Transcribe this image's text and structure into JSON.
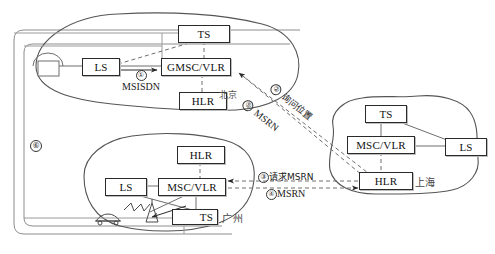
{
  "diagram": {
    "regions": [
      {
        "id": "beijing",
        "name": "北京",
        "label_x": 219,
        "label_y": 88
      },
      {
        "id": "shanghai",
        "name": "上海",
        "label_x": 415,
        "label_y": 176
      },
      {
        "id": "guangzhou",
        "name": "广州",
        "label_x": 212,
        "label_y": 212
      }
    ],
    "nodes": [
      {
        "id": "bj-ts",
        "label": "TS",
        "x": 178,
        "y": 25,
        "w": 50,
        "h": 16,
        "region": "beijing"
      },
      {
        "id": "bj-ls",
        "label": "LS",
        "x": 82,
        "y": 58,
        "w": 36,
        "h": 16,
        "region": "beijing"
      },
      {
        "id": "bj-gmsc",
        "label": "GMSC/VLR",
        "x": 161,
        "y": 58,
        "w": 68,
        "h": 16,
        "region": "beijing"
      },
      {
        "id": "bj-hlr",
        "label": "HLR",
        "x": 179,
        "y": 92,
        "w": 46,
        "h": 16,
        "region": "beijing"
      },
      {
        "id": "sh-ts",
        "label": "TS",
        "x": 365,
        "y": 105,
        "w": 40,
        "h": 16,
        "region": "shanghai"
      },
      {
        "id": "sh-mscvlr",
        "label": "MSC/VLR",
        "x": 347,
        "y": 136,
        "w": 66,
        "h": 16,
        "region": "shanghai"
      },
      {
        "id": "sh-ls",
        "label": "LS",
        "x": 445,
        "y": 138,
        "w": 40,
        "h": 16,
        "region": "shanghai"
      },
      {
        "id": "sh-hlr",
        "label": "HLR",
        "x": 359,
        "y": 172,
        "w": 52,
        "h": 16,
        "region": "shanghai"
      },
      {
        "id": "gz-hlr",
        "label": "HLR",
        "x": 177,
        "y": 146,
        "w": 46,
        "h": 16,
        "region": "guangzhou"
      },
      {
        "id": "gz-ls",
        "label": "LS",
        "x": 105,
        "y": 178,
        "w": 40,
        "h": 16,
        "region": "guangzhou"
      },
      {
        "id": "gz-mscvlr",
        "label": "MSC/VLR",
        "x": 158,
        "y": 178,
        "w": 66,
        "h": 16,
        "region": "guangzhou"
      },
      {
        "id": "gz-ts",
        "label": "TS",
        "x": 172,
        "y": 209,
        "w": 46,
        "h": 16,
        "region": "guangzhou"
      }
    ],
    "flows": [
      {
        "id": "flow1",
        "number": "①",
        "text": "MSISDN",
        "x": 120,
        "y": 76,
        "kind": "solid-arrow"
      },
      {
        "id": "flow2",
        "number": "②",
        "text": "询问位置",
        "x": 283,
        "y": 83,
        "kind": "dashed-arrow"
      },
      {
        "id": "flow5",
        "number": "⑤",
        "text": "MSRN",
        "x": 254,
        "y": 99,
        "kind": "dashed-arrow"
      },
      {
        "id": "flow3",
        "number": "③",
        "text": "请求MSRN",
        "x": 260,
        "y": 174,
        "kind": "dashed-arrow"
      },
      {
        "id": "flow4",
        "number": "④",
        "text": "MSRN",
        "x": 264,
        "y": 192,
        "kind": "dashed-arrow"
      },
      {
        "id": "flow6",
        "number": "⑥",
        "text": "",
        "x": 28,
        "y": 139,
        "kind": "label-only"
      }
    ],
    "icons": [
      {
        "id": "telephone",
        "name": "telephone-icon",
        "x": 33,
        "y": 61
      },
      {
        "id": "car",
        "name": "car-icon",
        "x": 99,
        "y": 215
      },
      {
        "id": "antenna",
        "name": "antenna-tower-icon",
        "x": 146,
        "y": 214
      },
      {
        "id": "radiowave",
        "name": "radio-wave-icon",
        "x": 118,
        "y": 205
      }
    ],
    "colors": {
      "stroke": "#2a2a2a",
      "light_stroke": "#8a8a8a",
      "background": "#ffffff",
      "text": "#111111"
    }
  }
}
